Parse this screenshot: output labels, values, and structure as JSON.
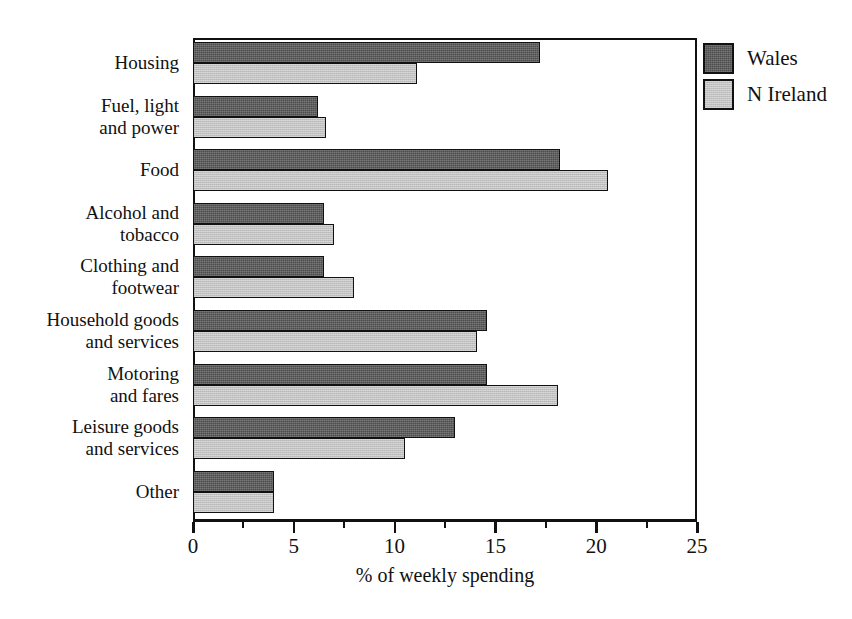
{
  "chart_data": {
    "type": "bar",
    "orientation": "horizontal",
    "title": "",
    "xlabel": "% of weekly spending",
    "ylabel": "",
    "xlim": [
      0,
      25
    ],
    "xticks": [
      0,
      5,
      10,
      15,
      20,
      25
    ],
    "xtick_labels": [
      "0",
      "5",
      "10",
      "15",
      "20",
      "25"
    ],
    "minor_tick_interval": 2.5,
    "grid": false,
    "legend_position": "top-right",
    "categories": [
      "Housing",
      "Fuel, light and power",
      "Food",
      "Alcohol and tobacco",
      "Clothing and footwear",
      "Household goods and services",
      "Motoring and fares",
      "Leisure goods and services",
      "Other"
    ],
    "category_lines": [
      [
        "Housing"
      ],
      [
        "Fuel, light",
        "and power"
      ],
      [
        "Food"
      ],
      [
        "Alcohol and",
        "tobacco"
      ],
      [
        "Clothing and",
        "footwear"
      ],
      [
        "Household goods",
        "and services"
      ],
      [
        "Motoring",
        "and fares"
      ],
      [
        "Leisure goods",
        "and services"
      ],
      [
        "Other"
      ]
    ],
    "series": [
      {
        "name": "Wales",
        "color": "#4d4d4d",
        "values": [
          17.2,
          6.2,
          18.2,
          6.5,
          6.5,
          14.6,
          14.6,
          13.0,
          4.0
        ]
      },
      {
        "name": "N Ireland",
        "color": "#c2c2c2",
        "values": [
          11.1,
          6.6,
          20.6,
          7.0,
          8.0,
          14.1,
          18.1,
          10.5,
          4.0
        ]
      }
    ]
  },
  "legend": {
    "entries": [
      {
        "label": "Wales",
        "swatch": "wales"
      },
      {
        "label": "N Ireland",
        "swatch": "nireland"
      }
    ]
  }
}
